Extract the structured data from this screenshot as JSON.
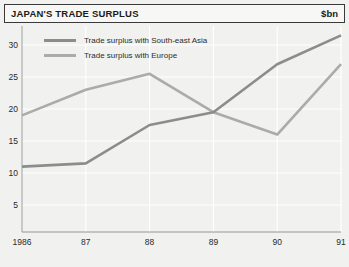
{
  "header": {
    "title": "JAPAN'S TRADE SURPLUS",
    "unit": "$bn"
  },
  "chart_data": {
    "type": "line",
    "title": "JAPAN'S TRADE SURPLUS",
    "xlabel": "",
    "ylabel": "$bn",
    "unit": "$bn",
    "categories": [
      "1986",
      "87",
      "88",
      "89",
      "90",
      "91"
    ],
    "xtick_labels": [
      "1986",
      "87",
      "88",
      "89",
      "90",
      "91"
    ],
    "ytick_labels": [
      "5",
      "10",
      "15",
      "20",
      "25",
      "30"
    ],
    "yticks": [
      5,
      10,
      15,
      20,
      25,
      30
    ],
    "ylim": [
      0,
      33
    ],
    "grid": true,
    "legend_position": "top-left",
    "series": [
      {
        "name": "Trade surplus with South-east Asia",
        "color": "#8c8c8c",
        "values": [
          11,
          11.5,
          17.5,
          19.5,
          27,
          31.5
        ]
      },
      {
        "name": "Trade surplus with Europe",
        "color": "#ababab",
        "values": [
          19,
          23,
          25.5,
          19.5,
          16,
          27
        ]
      }
    ]
  },
  "legend": [
    {
      "label": "Trade surplus with South-east Asia",
      "color": "#8c8c8c"
    },
    {
      "label": "Trade surplus with Europe",
      "color": "#ababab"
    }
  ],
  "colors": {
    "background": "#f1f1ef",
    "gridline": "#ffffff",
    "axis": "#8d8d8d",
    "border": "#3a3a3a",
    "text": "#1b1b1b",
    "series_southeast_asia": "#8c8c8c",
    "series_europe": "#ababab"
  }
}
